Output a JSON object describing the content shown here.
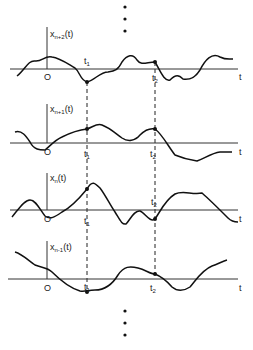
{
  "diagram": {
    "time_axis_label": "t",
    "origin_label": "O",
    "sample_times": [
      "t1",
      "t2"
    ],
    "ellipsis_top": "⋮",
    "ellipsis_bottom": "⋮",
    "panels": [
      {
        "label_base": "x",
        "label_sub": "n+2",
        "label_arg": "(t)"
      },
      {
        "label_base": "x",
        "label_sub": "n+1",
        "label_arg": "(t)"
      },
      {
        "label_base": "x",
        "label_sub": "n",
        "label_arg": "(t)"
      },
      {
        "label_base": "x",
        "label_sub": "n-1",
        "label_arg": "(t)"
      }
    ]
  }
}
